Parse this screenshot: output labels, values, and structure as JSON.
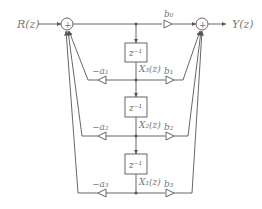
{
  "diagram": {
    "type": "signal-flow",
    "input_label": "R(z)",
    "output_label": "Y(z)",
    "summer_symbol": "+",
    "delay_label": "z⁻¹",
    "feedforward_gains": [
      "b₀",
      "b₁",
      "b₂",
      "b₃"
    ],
    "feedback_gains": [
      "−a₁",
      "−a₂",
      "−a₃"
    ],
    "state_labels": [
      "X₃(z)",
      "X₂(z)",
      "X₁(z)"
    ],
    "colors": {
      "line": "#555555",
      "text": "#777777"
    }
  }
}
